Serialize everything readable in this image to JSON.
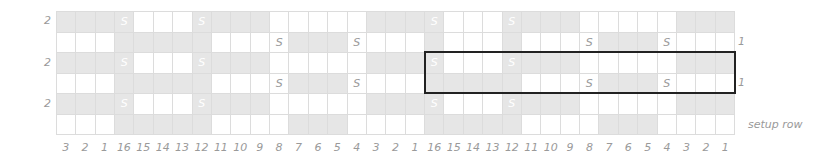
{
  "chart_data": {
    "type": "table",
    "columns": 35,
    "rows": 6,
    "column_labels": [
      "3",
      "2",
      "1",
      "16",
      "15",
      "14",
      "13",
      "12",
      "11",
      "10",
      "9",
      "8",
      "7",
      "6",
      "5",
      "4",
      "3",
      "2",
      "1",
      "16",
      "15",
      "14",
      "13",
      "12",
      "11",
      "10",
      "9",
      "8",
      "7",
      "6",
      "5",
      "4",
      "3",
      "2",
      "1"
    ],
    "legend": {
      "S": "slip stitch",
      "shaded": "contrast color",
      "white": "main color"
    },
    "grid": [
      {
        "row_index": 0,
        "left_label": "2",
        "right_label": "",
        "shaded": [
          0,
          1,
          2,
          3,
          7,
          8,
          9,
          10,
          16,
          17,
          18,
          19,
          23,
          24,
          25,
          26,
          32,
          33,
          34
        ],
        "symbols": {
          "3": "S",
          "7": "S",
          "19": "S",
          "23": "S"
        }
      },
      {
        "row_index": 1,
        "left_label": "",
        "right_label": "1",
        "shaded": [
          3,
          4,
          5,
          6,
          7,
          12,
          13,
          14,
          19,
          23,
          28,
          29,
          30
        ],
        "symbols": {
          "11": "S",
          "15": "S",
          "27": "S",
          "31": "S"
        }
      },
      {
        "row_index": 2,
        "left_label": "2",
        "right_label": "",
        "shaded": [
          0,
          1,
          2,
          3,
          7,
          8,
          9,
          10,
          16,
          17,
          18,
          19,
          23,
          24,
          25,
          26,
          32,
          33,
          34
        ],
        "symbols": {
          "3": "S",
          "7": "S",
          "19": "S",
          "23": "S"
        }
      },
      {
        "row_index": 3,
        "left_label": "",
        "right_label": "1",
        "shaded": [
          3,
          4,
          5,
          6,
          7,
          12,
          13,
          14,
          19,
          20,
          21,
          22,
          23,
          28,
          29,
          30
        ],
        "symbols": {
          "11": "S",
          "15": "S",
          "27": "S",
          "31": "S"
        }
      },
      {
        "row_index": 4,
        "left_label": "2",
        "right_label": "",
        "shaded": [
          0,
          1,
          2,
          3,
          7,
          8,
          9,
          10,
          16,
          17,
          18,
          19,
          23,
          24,
          25,
          26,
          32,
          33,
          34
        ],
        "symbols": {
          "3": "S",
          "7": "S",
          "19": "S",
          "23": "S"
        }
      },
      {
        "row_index": 5,
        "left_label": "",
        "right_label": "setup row",
        "shaded": [
          3,
          4,
          5,
          6,
          7,
          12,
          13,
          14,
          19,
          20,
          21,
          22,
          23,
          28,
          29,
          30
        ],
        "symbols": {}
      }
    ],
    "repeat_box": {
      "start_col": 19,
      "end_col": 34,
      "start_row": 2,
      "end_row": 3
    },
    "colors": {
      "shaded": "#e6e6e6",
      "white": "#ffffff",
      "gridline": "#dcdcdc",
      "label": "#9a9a9a",
      "box": "#222222"
    }
  }
}
